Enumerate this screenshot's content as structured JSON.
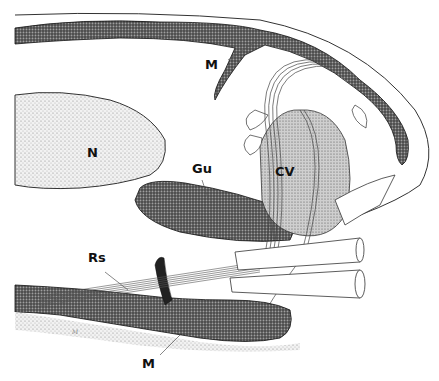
{
  "figure": {
    "type": "anatomical-illustration",
    "labels": {
      "muscle_top": "M",
      "nerve": "N",
      "gut": "Gu",
      "cv": "CV",
      "rs": "Rs",
      "muscle_bottom": "M",
      "scale_mark": "M"
    }
  },
  "colors": {
    "background": "#ffffff",
    "ink": "#111111",
    "stipple_light": "#d9d9d9",
    "stipple_dark": "#5a5a5a"
  }
}
